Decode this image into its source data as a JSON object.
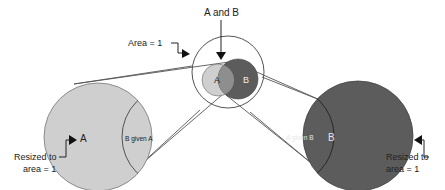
{
  "labels": {
    "a_and_b": "A and B",
    "area_one": "Area = 1",
    "small_a": "A",
    "small_b": "B",
    "left_a": "A",
    "left_b_given_a": "B given A",
    "right_a_given_b": "A given B",
    "right_b": "B",
    "left_resized_line1": "Resized to",
    "left_resized_line2": "area = 1",
    "right_resized_line1": "Resized to",
    "right_resized_line2": "area = 1"
  },
  "colors": {
    "light_gray": "#cfcfcf",
    "dark_gray": "#5c5c5c",
    "overlap": "#8e8e8e",
    "stroke": "#444444"
  }
}
